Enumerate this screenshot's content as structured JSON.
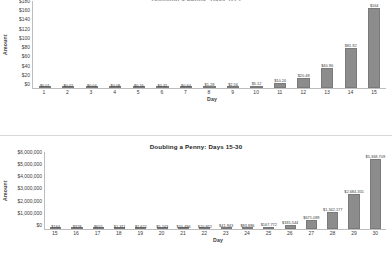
{
  "chart_data": [
    {
      "type": "bar",
      "title": "Doubling a Penny:  Days 1-15",
      "xlabel": "Day",
      "ylabel": "Amount",
      "ylim": [
        0,
        180
      ],
      "yticks": [
        "$0",
        "$20",
        "$40",
        "$60",
        "$80",
        "$100",
        "$120",
        "$140",
        "$160",
        "$180"
      ],
      "grid": false,
      "legend": "none",
      "bar_color": "#8c8c8c",
      "categories": [
        "1",
        "2",
        "3",
        "4",
        "5",
        "6",
        "7",
        "8",
        "9",
        "10",
        "11",
        "12",
        "13",
        "14",
        "15"
      ],
      "values": [
        0.01,
        0.02,
        0.04,
        0.08,
        0.16,
        0.32,
        0.64,
        1.28,
        2.56,
        5.12,
        10.24,
        20.48,
        40.96,
        81.92,
        163.84
      ],
      "data_labels": [
        "$0.01",
        "$0.02",
        "$0.04",
        "$0.08",
        "$0.16",
        "$0.32",
        "$0.64",
        "$1.28",
        "$2.56",
        "$5.12",
        "$10.24",
        "$20.48",
        "$40.96",
        "$81.92",
        "$164"
      ]
    },
    {
      "type": "bar",
      "title": "Doubling a Penny:  Days 15-30",
      "xlabel": "Day",
      "ylabel": "Amount",
      "ylim": [
        0,
        6000000
      ],
      "yticks": [
        "$0",
        "$1,000,000",
        "$2,000,000",
        "$3,000,000",
        "$4,000,000",
        "$5,000,000",
        "$6,000,000"
      ],
      "grid": false,
      "legend": "none",
      "bar_color": "#8c8c8c",
      "categories": [
        "15",
        "16",
        "17",
        "18",
        "19",
        "20",
        "21",
        "22",
        "23",
        "24",
        "25",
        "26",
        "27",
        "28",
        "29",
        "30"
      ],
      "values": [
        164,
        328,
        655,
        1311,
        2621,
        5243,
        10486,
        20972,
        41943,
        83886,
        167772,
        335544,
        671089,
        1342177,
        2684355,
        5368709
      ],
      "data_labels": [
        "$164",
        "$328",
        "$655",
        "$1,311",
        "$2,621",
        "$5,243",
        "$10,486",
        "$20,972",
        "$41,943",
        "$83,886",
        "$167,772",
        "$335,544",
        "$671,089",
        "$1,342,177",
        "$2,684,355",
        "$5,368,709"
      ]
    }
  ]
}
